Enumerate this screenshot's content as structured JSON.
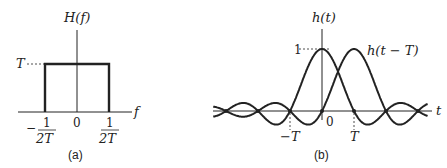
{
  "panel_a": {
    "caption": "(a)",
    "ylabel": "H(f)",
    "xlabel": "f",
    "level_label": "T",
    "origin_label": "0",
    "left_edge": {
      "sign": "−",
      "num": "1",
      "den": "2T"
    },
    "right_edge": {
      "num": "1",
      "den": "2T"
    }
  },
  "panel_b": {
    "caption": "(b)",
    "ylabel": "h(t)",
    "xlabel": "t",
    "peak_label": "1",
    "origin_label": "0",
    "neg_T_label": "−T",
    "pos_T_label": "T",
    "shifted_label": "h(t − T)"
  },
  "chart_data": [
    {
      "type": "area",
      "title": "H(f) ideal low-pass spectrum",
      "xlabel": "f",
      "ylabel": "H(f)",
      "x": [
        -0.5,
        -0.5,
        0.5,
        0.5
      ],
      "y": [
        0,
        1,
        1,
        0
      ],
      "xticks": [
        "-1/2T",
        "0",
        "1/2T"
      ],
      "yticks": [
        "T"
      ]
    },
    {
      "type": "line",
      "title": "sinc pulses h(t) and h(t-T)",
      "xlabel": "t",
      "ylabel": "h(t)",
      "series": [
        {
          "name": "h(t)",
          "shift": 0
        },
        {
          "name": "h(t - T)",
          "shift": 1
        }
      ],
      "xrange": [
        -3.4,
        3.3
      ],
      "xticks": [
        "-T",
        "0",
        "T"
      ],
      "yticks": [
        "1"
      ]
    }
  ]
}
